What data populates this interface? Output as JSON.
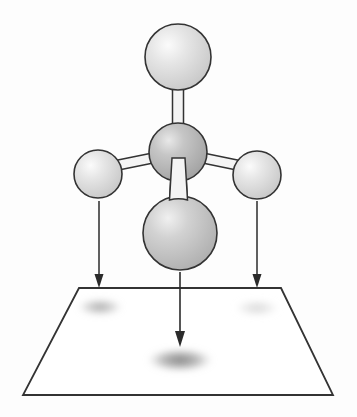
{
  "figure": {
    "title": "Tetrahedral molecule projecting shadows onto a plane",
    "type": "scientific-diagram",
    "canvas": {
      "width": 357,
      "height": 417,
      "background": "#fdfdfd"
    },
    "labels": {
      "none_visible": ""
    }
  },
  "style": {
    "outline_color": "#333333",
    "outline_width": 1.6,
    "sphere_light_fill": "#dcdcdc",
    "sphere_light_highlight": "#f2f2f2",
    "sphere_dark_fill": "#b4b4b4",
    "sphere_dark_highlight": "#e0e0e0",
    "sphere_medium_fill": "#c4c4c4",
    "bond_fill": "#f4f4f4",
    "bond_stroke": "#333333",
    "arrow_color": "#2b2b2b",
    "plane_stroke": "#333333",
    "shadow_dark": "#8c8c8c",
    "shadow_light": "#c9c9c9",
    "shadow_mid": "#a6a6a6"
  },
  "atoms": [
    {
      "name": "top-atom",
      "role": "upper substituent",
      "cx": 178,
      "cy": 57,
      "r": 33,
      "shade": "light",
      "highlight_dx": -10,
      "highlight_dy": -12
    },
    {
      "name": "left-atom",
      "role": "left substituent",
      "cx": 98,
      "cy": 174,
      "r": 24,
      "shade": "light",
      "highlight_dx": -8,
      "highlight_dy": -8
    },
    {
      "name": "right-atom",
      "role": "right substituent",
      "cx": 257,
      "cy": 175,
      "r": 24,
      "shade": "light",
      "highlight_dx": -8,
      "highlight_dy": -8
    },
    {
      "name": "central-atom",
      "role": "central atom",
      "cx": 178,
      "cy": 152,
      "r": 29,
      "shade": "dark",
      "highlight_dx": -9,
      "highlight_dy": -10
    },
    {
      "name": "bottom-atom",
      "role": "front substituent",
      "cx": 180,
      "cy": 233,
      "r": 37,
      "shade": "medium",
      "highlight_dx": -12,
      "highlight_dy": -13
    }
  ],
  "bonds": [
    {
      "name": "bond-center-top",
      "from": "central-atom",
      "to": "top-atom",
      "x1": 178,
      "y1": 152,
      "x2": 178,
      "y2": 62,
      "width": 11
    },
    {
      "name": "bond-center-left",
      "from": "central-atom",
      "to": "left-atom",
      "x1": 176,
      "y1": 156,
      "x2": 104,
      "y2": 172,
      "width": 10
    },
    {
      "name": "bond-center-right",
      "from": "central-atom",
      "to": "right-atom",
      "x1": 180,
      "y1": 156,
      "x2": 251,
      "y2": 173,
      "width": 10
    },
    {
      "name": "bond-center-bottom",
      "from": "central-atom",
      "to": "bottom-atom",
      "x1": 178,
      "y1": 158,
      "x2": 180,
      "y2": 208,
      "width": 13
    }
  ],
  "arrows": [
    {
      "name": "projection-arrow-left",
      "x": 99,
      "y_start": 201,
      "y_end": 288,
      "head_width": 9,
      "head_length": 14
    },
    {
      "name": "projection-arrow-center",
      "x": 180,
      "y_start": 272,
      "y_end": 347,
      "head_width": 10,
      "head_length": 16
    },
    {
      "name": "projection-arrow-right",
      "x": 257,
      "y_start": 201,
      "y_end": 288,
      "head_width": 9,
      "head_length": 14
    }
  ],
  "plane": {
    "name": "projection-plane",
    "shape": "trapezoid",
    "points": "79,288 281,288 333,395 23,395",
    "fill": "none",
    "stroke_width": 1.8
  },
  "shadows": [
    {
      "name": "shadow-left",
      "cx": 100,
      "cy": 307,
      "rx": 23,
      "ry": 9,
      "intensity": 0.55,
      "color": "#8c8c8c"
    },
    {
      "name": "shadow-right",
      "cx": 257,
      "cy": 308,
      "rx": 23,
      "ry": 9,
      "intensity": 0.3,
      "color": "#b5b5b5"
    },
    {
      "name": "shadow-center",
      "cx": 180,
      "cy": 360,
      "rx": 33,
      "ry": 12,
      "intensity": 0.7,
      "color": "#7f7f7f"
    }
  ]
}
